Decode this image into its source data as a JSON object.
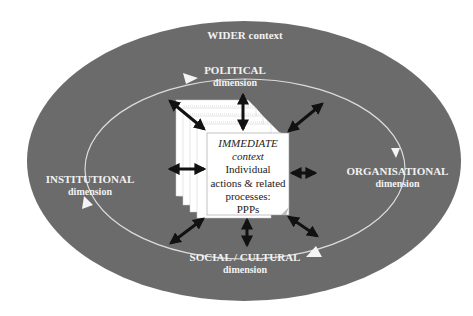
{
  "diagram": {
    "outer": {
      "label": "WIDER context",
      "fill": "#6b6b6b"
    },
    "dimensions": [
      {
        "id": "political",
        "title": "POLITICAL",
        "subtitle": "dimension"
      },
      {
        "id": "organisational",
        "title": "ORGANISATIONAL",
        "subtitle": "dimension"
      },
      {
        "id": "social",
        "title": "SOCIAL / CULTURAL",
        "subtitle": "dimension"
      },
      {
        "id": "institutional",
        "title": "INSTITUTIONAL",
        "subtitle": "dimension"
      }
    ],
    "center": {
      "title": "IMMEDIATE",
      "subtitle": "context",
      "lines": [
        "Individual",
        "actions & related",
        "processes:",
        "PPPs"
      ]
    },
    "colors": {
      "background": "#ffffff",
      "ellipse": "#6b6b6b",
      "ring": "#e6e6e6",
      "box": "#ffffff",
      "arrow": "#111111",
      "label": "#f2f2f2"
    }
  }
}
